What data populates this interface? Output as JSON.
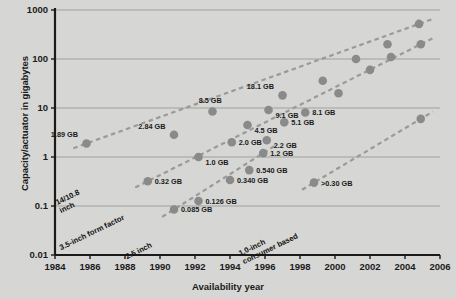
{
  "chart_data": {
    "type": "scatter",
    "title": "",
    "xlabel": "Availability year",
    "ylabel": "Capacity/actuator in gigabytes",
    "xlim": [
      1984,
      2006
    ],
    "ylim": [
      0.01,
      1000
    ],
    "yscale": "log",
    "grid": true,
    "legend": "none (inline series annotations)",
    "xticks": [
      "1984",
      "1986",
      "1988",
      "1990",
      "1992",
      "1994",
      "1996",
      "1998",
      "2000",
      "2002",
      "2004",
      "2006"
    ],
    "yticks": [
      "0.01",
      "0.1",
      "1",
      "10",
      "100",
      "1000"
    ],
    "series": [
      {
        "name": "14/10.8 inch",
        "annotation": "14/10.8 inch",
        "points": [
          {
            "x": 1985.8,
            "y": 1.89,
            "label": "1.89 GB",
            "label_pos": "above-left"
          },
          {
            "x": 1990.8,
            "y": 2.84,
            "label": "2.84 GB",
            "label_pos": "above-left"
          },
          {
            "x": 1993.0,
            "y": 8.5,
            "label": "8.5 GB",
            "label_pos": "above"
          },
          {
            "x": 1995.0,
            "y": 4.5,
            "label": "4.5 GB",
            "label_pos": "below-right"
          },
          {
            "x": 1996.2,
            "y": 9.1,
            "label": "9.1 GB",
            "label_pos": "below-right"
          },
          {
            "x": 1997.0,
            "y": 18.1,
            "label": "18.1 GB",
            "label_pos": "above-left"
          },
          {
            "x": 1999.3,
            "y": 36.0,
            "label": "",
            "label_pos": ""
          },
          {
            "x": 2001.2,
            "y": 100.0,
            "label": "",
            "label_pos": ""
          },
          {
            "x": 2003.0,
            "y": 200.0,
            "label": "",
            "label_pos": ""
          },
          {
            "x": 2004.8,
            "y": 520.0,
            "label": "",
            "label_pos": ""
          }
        ]
      },
      {
        "name": "3.5-inch form factor",
        "annotation": "3.5-inch form factor",
        "points": [
          {
            "x": 1989.3,
            "y": 0.32,
            "label": "0.32 GB",
            "label_pos": "right"
          },
          {
            "x": 1992.2,
            "y": 1.0,
            "label": "1.0 GB",
            "label_pos": "below-right"
          },
          {
            "x": 1994.1,
            "y": 2.0,
            "label": "2.0 GB",
            "label_pos": "right"
          },
          {
            "x": 1996.1,
            "y": 2.2,
            "label": "2.2 GB",
            "label_pos": "below-right"
          },
          {
            "x": 1997.1,
            "y": 5.1,
            "label": "5.1 GB",
            "label_pos": "right"
          },
          {
            "x": 1998.3,
            "y": 8.1,
            "label": "8.1 GB",
            "label_pos": "right"
          },
          {
            "x": 2000.2,
            "y": 20.0,
            "label": "",
            "label_pos": ""
          },
          {
            "x": 2002.0,
            "y": 60.0,
            "label": "",
            "label_pos": ""
          },
          {
            "x": 2003.2,
            "y": 110.0,
            "label": "",
            "label_pos": ""
          },
          {
            "x": 2004.9,
            "y": 200.0,
            "label": "",
            "label_pos": ""
          }
        ]
      },
      {
        "name": "2.5 inch",
        "annotation": "2.5 inch",
        "points": [
          {
            "x": 1990.8,
            "y": 0.085,
            "label": "0.085 GB",
            "label_pos": "right"
          },
          {
            "x": 1992.2,
            "y": 0.126,
            "label": "0.126 GB",
            "label_pos": "right"
          },
          {
            "x": 1994.0,
            "y": 0.34,
            "label": "0.340 GB",
            "label_pos": "right"
          },
          {
            "x": 1995.1,
            "y": 0.54,
            "label": "0.540 GB",
            "label_pos": "right"
          },
          {
            "x": 1995.9,
            "y": 1.2,
            "label": "1.2 GB",
            "label_pos": "right"
          }
        ]
      },
      {
        "name": "1.0-inch consumer based",
        "annotation": "1.0-inch consumer based",
        "points": [
          {
            "x": 1998.8,
            "y": 0.3,
            "label": ">0.30 GB",
            "label_pos": "right"
          },
          {
            "x": 2004.9,
            "y": 6.0,
            "label": "",
            "label_pos": ""
          }
        ]
      }
    ]
  },
  "colors": {
    "background": "#d6d6d4",
    "plot_area": "#d6d6d4",
    "marker": "#8a8a8a",
    "trend_line": "#9a9a9a",
    "gridline": "#9b9b9b",
    "axis": "#1a1a1a",
    "text": "#1b1b1b"
  }
}
